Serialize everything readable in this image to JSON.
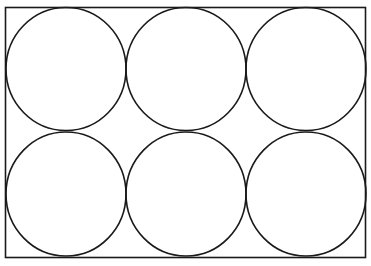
{
  "diagram": {
    "stroke_color": "#1a1a1a",
    "background": "#ffffff",
    "rectangle": {
      "x": 5.5,
      "y": 7.5,
      "width": 360,
      "height": 250
    },
    "grid": {
      "rows": 2,
      "cols": 3
    },
    "circles": [
      {
        "cx": 66,
        "cy": 69,
        "rx": 60,
        "ry": 61.5
      },
      {
        "cx": 186,
        "cy": 69,
        "rx": 60,
        "ry": 61.5
      },
      {
        "cx": 306,
        "cy": 69,
        "rx": 60,
        "ry": 61.5
      },
      {
        "cx": 66,
        "cy": 194,
        "rx": 60,
        "ry": 62
      },
      {
        "cx": 186,
        "cy": 194,
        "rx": 60,
        "ry": 62
      },
      {
        "cx": 306,
        "cy": 194,
        "rx": 60,
        "ry": 62
      }
    ]
  }
}
